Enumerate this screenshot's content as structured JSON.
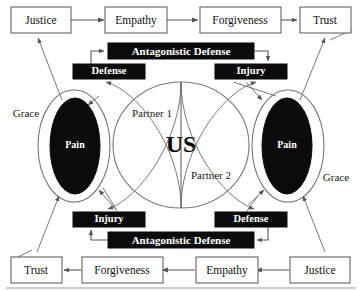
{
  "diagram": {
    "center_label": "US",
    "partner_labels": {
      "upper": "Partner 1",
      "lower": "Partner 2"
    },
    "grace_labels": {
      "left": "Grace",
      "right": "Grace"
    },
    "core_labels": {
      "left_pain": "Pain",
      "right_pain": "Pain"
    },
    "top_chain": [
      {
        "id": "top-justice",
        "label": "Justice"
      },
      {
        "id": "top-empathy",
        "label": "Empathy"
      },
      {
        "id": "top-forgiveness",
        "label": "Forgiveness"
      },
      {
        "id": "top-trust",
        "label": "Trust"
      }
    ],
    "bottom_chain": [
      {
        "id": "bottom-trust",
        "label": "Trust"
      },
      {
        "id": "bottom-forgiveness",
        "label": "Forgiveness"
      },
      {
        "id": "bottom-empathy",
        "label": "Empathy"
      },
      {
        "id": "bottom-justice",
        "label": "Justice"
      }
    ],
    "black_boxes": {
      "top_antagonistic_defense": "Antagonistic Defense",
      "top_defense": "Defense",
      "top_injury": "Injury",
      "bottom_injury": "Injury",
      "bottom_defense": "Defense",
      "bottom_antagonistic_defense": "Antagonistic Defense"
    },
    "colors": {
      "black_box_fill": "#0b0b0b",
      "black_box_text": "#ffffff",
      "white_box_fill": "#ffffff",
      "white_box_stroke": "#555555",
      "connector": "#555555",
      "page_background": "#ffffff"
    }
  }
}
